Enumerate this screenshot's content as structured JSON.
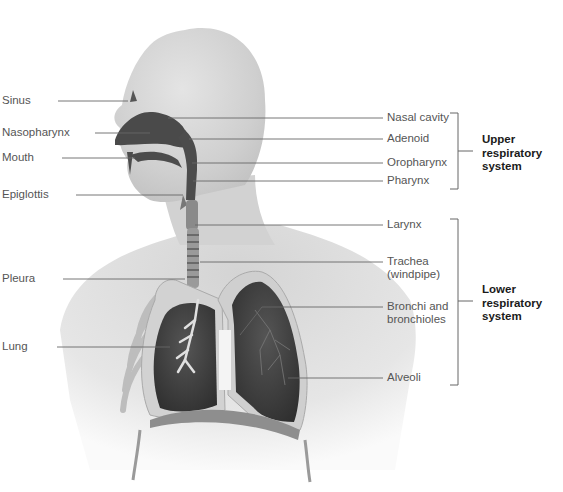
{
  "diagram": {
    "left_labels": [
      {
        "id": "sinus",
        "text": "Sinus"
      },
      {
        "id": "nasopharynx",
        "text": "Nasopharynx"
      },
      {
        "id": "mouth",
        "text": "Mouth"
      },
      {
        "id": "epiglottis",
        "text": "Epiglottis"
      },
      {
        "id": "pleura",
        "text": "Pleura"
      },
      {
        "id": "lung",
        "text": "Lung"
      }
    ],
    "right_labels": [
      {
        "id": "nasal-cavity",
        "text": "Nasal cavity"
      },
      {
        "id": "adenoid",
        "text": "Adenoid"
      },
      {
        "id": "oropharynx",
        "text": "Oropharynx"
      },
      {
        "id": "pharynx",
        "text": "Pharynx"
      },
      {
        "id": "larynx",
        "text": "Larynx"
      },
      {
        "id": "trachea",
        "text": "Trachea\n(windpipe)"
      },
      {
        "id": "bronchi",
        "text": "Bronchi and\nbronchioles"
      },
      {
        "id": "alveoli",
        "text": "Alveoli"
      }
    ],
    "groups": [
      {
        "id": "upper",
        "text": "Upper\nrespiratory\nsystem",
        "members": [
          "Nasal cavity",
          "Adenoid",
          "Oropharynx",
          "Pharynx"
        ]
      },
      {
        "id": "lower",
        "text": "Lower\nrespiratory\nsystem",
        "members": [
          "Larynx",
          "Trachea (windpipe)",
          "Bronchi and bronchioles",
          "Alveoli"
        ]
      }
    ],
    "colors": {
      "skin": "#d8d8d8",
      "airway": "#4a4a4a",
      "lung_tissue": "#3e3e3e",
      "pleura": "#d0d0d0",
      "leader_line": "#666666",
      "label_text": "#555555",
      "group_text": "#1a1a1a"
    }
  }
}
